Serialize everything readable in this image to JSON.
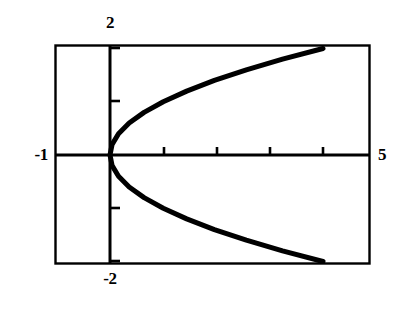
{
  "figure": {
    "background_color": "#ffffff",
    "ink_color": "#000000"
  },
  "labels": {
    "y_max": "2",
    "y_min": "-2",
    "x_min": "-1",
    "x_max": "5"
  },
  "chart_data": {
    "type": "line",
    "title": "",
    "subtitle": "",
    "xlabel": "",
    "ylabel": "",
    "equation": "x = y^2",
    "grid": false,
    "legend": null,
    "legend_position": "none",
    "xlim": [
      -1,
      5
    ],
    "ylim": [
      -2,
      2
    ],
    "x_tick_values": [
      1,
      2,
      3,
      4
    ],
    "y_tick_values": [
      -2,
      -1,
      1,
      2
    ],
    "x_tick_labels": [
      "",
      "",
      "",
      ""
    ],
    "y_tick_labels": [
      "",
      "",
      "",
      ""
    ],
    "corner_labels": {
      "left_of_frame": "-1",
      "right_of_frame": "5",
      "above_frame": "2",
      "below_frame": "-2"
    },
    "axis_origin": [
      0,
      0
    ],
    "line_width_px": 5,
    "line_color": "#000000",
    "series": [
      {
        "name": "x = y^2",
        "x": [
          4.0,
          3.24,
          2.56,
          1.96,
          1.44,
          1.0,
          0.64,
          0.36,
          0.16,
          0.04,
          0.0,
          0.04,
          0.16,
          0.36,
          0.64,
          1.0,
          1.44,
          1.96,
          2.56,
          3.24,
          4.0
        ],
        "y": [
          2.0,
          1.8,
          1.6,
          1.4,
          1.2,
          1.0,
          0.8,
          0.6,
          0.4,
          0.2,
          0.0,
          -0.2,
          -0.4,
          -0.6,
          -0.8,
          -1.0,
          -1.2,
          -1.4,
          -1.6,
          -1.8,
          -2.0
        ]
      }
    ],
    "endpoints": [
      {
        "label": "upper-endpoint",
        "x": 4,
        "y": 2
      },
      {
        "label": "vertex",
        "x": 0,
        "y": 0
      },
      {
        "label": "lower-endpoint",
        "x": 4,
        "y": -2
      }
    ]
  }
}
